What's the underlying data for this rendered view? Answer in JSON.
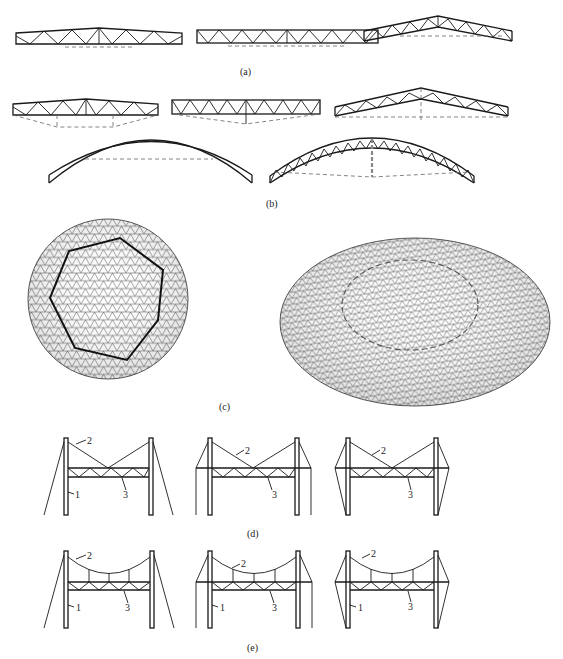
{
  "figure": {
    "captions": {
      "a": "(a)",
      "b": "(b)",
      "c": "(c)",
      "d": "(d)",
      "e": "(e)"
    },
    "panels": {
      "a": {
        "items": [
          "trapezoidal-truss",
          "parallel-chord-truss",
          "pitched-truss"
        ]
      },
      "b": {
        "items": [
          "trapezoidal-truss-with-tie",
          "parallel-chord-truss-with-tie",
          "pitched-truss-with-tie",
          "solid-arch",
          "trussed-arch"
        ]
      },
      "c": {
        "items": [
          "dome-plan-view",
          "dome-perspective-view"
        ]
      },
      "d": {
        "items": [
          "cable-stayed-outward-guy",
          "cable-stayed-vertical-backstay",
          "cable-stayed-inclined-backstay"
        ]
      },
      "e": {
        "items": [
          "suspended-outward-guy",
          "suspended-vertical-backstay",
          "suspended-inclined-backstay"
        ]
      }
    },
    "labels": {
      "tower": "1",
      "cable": "2",
      "truss": "3"
    }
  }
}
